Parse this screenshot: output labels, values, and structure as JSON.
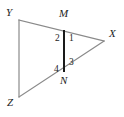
{
  "figure": {
    "type": "geometry-diagram",
    "width": 124,
    "height": 117,
    "background_color": "#ffffff",
    "stroke_color_triangle": "#8a8a8a",
    "stroke_color_segment": "#1a1a1a",
    "label_color": "#1c1c1c",
    "vertices": [
      {
        "id": "Y",
        "label": "Y",
        "x": 19,
        "y": 20,
        "label_x": 6,
        "label_y": 7
      },
      {
        "id": "Z",
        "label": "Z",
        "x": 19,
        "y": 97,
        "label_x": 7,
        "label_y": 97
      },
      {
        "id": "X",
        "label": "X",
        "x": 104,
        "y": 41,
        "label_x": 109,
        "label_y": 28
      },
      {
        "id": "M",
        "label": "M",
        "x": 64,
        "y": 31,
        "label_x": 59,
        "label_y": 8
      },
      {
        "id": "N",
        "label": "N",
        "x": 64,
        "y": 71,
        "label_x": 60,
        "label_y": 75
      }
    ],
    "edges": [
      {
        "id": "YZ",
        "from": "Y",
        "to": "Z",
        "style": "thin-gray"
      },
      {
        "id": "YX",
        "from": "Y",
        "to": "X",
        "style": "thin-gray"
      },
      {
        "id": "ZX",
        "from": "Z",
        "to": "X",
        "style": "thin-gray"
      },
      {
        "id": "MN",
        "from": "M",
        "to": "N",
        "style": "thick-black"
      }
    ],
    "angle_labels": [
      {
        "id": "angle-1",
        "label": "1",
        "x": 69,
        "y": 34
      },
      {
        "id": "angle-2",
        "label": "2",
        "x": 55,
        "y": 34
      },
      {
        "id": "angle-3",
        "label": "3",
        "x": 69,
        "y": 58
      },
      {
        "id": "angle-4",
        "label": "4",
        "x": 54,
        "y": 65
      }
    ]
  }
}
